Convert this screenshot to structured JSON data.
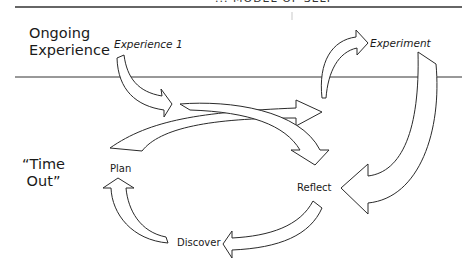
{
  "header": {
    "cut_off_text": "... MODEL OF SELF"
  },
  "rows": {
    "top": {
      "label_line1": "Ongoing",
      "label_line2": "Experience"
    },
    "bottom": {
      "label_line1": "“Time",
      "label_line2": "Out”"
    }
  },
  "nodes": {
    "experience1": "Experience 1",
    "experiment": "Experiment",
    "plan": "Plan",
    "reflect": "Reflect",
    "discover": "Discover"
  },
  "colors": {
    "line": "#333333",
    "arrow_fill": "#ffffff",
    "arrow_stroke": "#2a2a2a",
    "text": "#1a1a1a"
  },
  "edges": [
    {
      "from": "Experience 1",
      "to": "Plan-Experiment arrow"
    },
    {
      "from": "Plan",
      "to": "Experiment"
    },
    {
      "from": "Plan",
      "to": "Reflect"
    },
    {
      "from": "Experiment",
      "to": "Reflect"
    },
    {
      "from": "Reflect",
      "to": "Discover"
    },
    {
      "from": "Discover",
      "to": "Plan"
    }
  ]
}
